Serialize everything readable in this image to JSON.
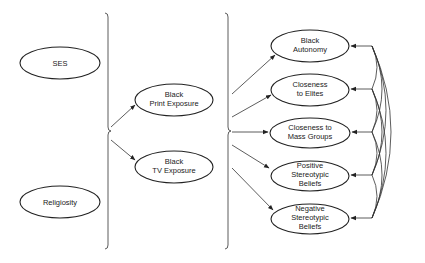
{
  "diagram": {
    "type": "path-model",
    "exogenous": [
      {
        "id": "ses",
        "label": "SES"
      },
      {
        "id": "religiosity",
        "label": "Religiosity"
      }
    ],
    "mediators": [
      {
        "id": "print",
        "line1": "Black",
        "line2": "Print Exposure"
      },
      {
        "id": "tv",
        "line1": "Black",
        "line2": "TV Exposure"
      }
    ],
    "outcomes": [
      {
        "id": "autonomy",
        "lines": [
          "Black",
          "Autonomy"
        ]
      },
      {
        "id": "elites",
        "lines": [
          "Closeness",
          "to Elites"
        ]
      },
      {
        "id": "mass",
        "lines": [
          "Closeness to",
          "Mass Groups"
        ]
      },
      {
        "id": "positive",
        "lines": [
          "Positive",
          "Stereotypic",
          "Beliefs"
        ]
      },
      {
        "id": "negative",
        "lines": [
          "Negative",
          "Stereotypic",
          "Beliefs"
        ]
      }
    ],
    "edges": [
      {
        "from": "exogenous-group",
        "to": "print"
      },
      {
        "from": "exogenous-group",
        "to": "tv"
      },
      {
        "from": "mediator-group",
        "to": "autonomy"
      },
      {
        "from": "mediator-group",
        "to": "elites"
      },
      {
        "from": "mediator-group",
        "to": "mass"
      },
      {
        "from": "mediator-group",
        "to": "positive"
      },
      {
        "from": "mediator-group",
        "to": "negative"
      }
    ],
    "correlations": "all pairs of outcome variables correlated (curved double-headed arcs on right)",
    "colors": {
      "stroke": "#222222",
      "background": "#ffffff"
    }
  }
}
